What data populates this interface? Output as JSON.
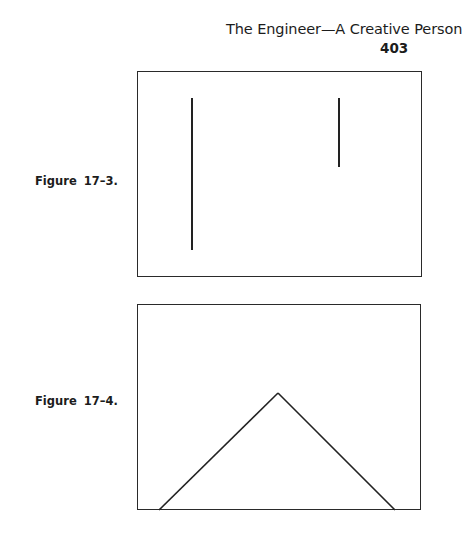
{
  "header": {
    "running_title": "The Engineer—A Creative Person",
    "page_number": "403"
  },
  "figures": [
    {
      "label": "Figure 17–3.",
      "description": "Two vertical line segments of unequal length inside a rectangle",
      "elements": [
        {
          "type": "line",
          "name": "long-vertical-line",
          "x1": 54,
          "y1": 26,
          "x2": 54,
          "y2": 178
        },
        {
          "type": "line",
          "name": "short-vertical-line",
          "x1": 201,
          "y1": 26,
          "x2": 201,
          "y2": 95
        }
      ]
    },
    {
      "label": "Figure 17–4.",
      "description": "Two diagonal lines meeting at an apex forming an inverted V / triangle shape inside a rectangle",
      "elements": [
        {
          "type": "line",
          "name": "left-diagonal-line",
          "x1": 21,
          "y1": 205,
          "x2": 140,
          "y2": 88
        },
        {
          "type": "line",
          "name": "right-diagonal-line",
          "x1": 140,
          "y1": 88,
          "x2": 257,
          "y2": 205
        }
      ]
    }
  ]
}
